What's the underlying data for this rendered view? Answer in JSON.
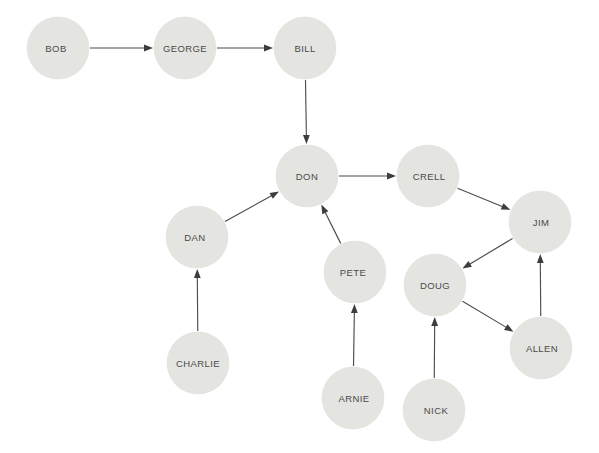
{
  "diagram": {
    "type": "directed-graph",
    "background_color": "#ffffff",
    "node_fill_color": "#e4e4e1",
    "node_text_color": "#4a4a4a",
    "edge_color": "#4d4d4d",
    "node_radius": 31,
    "canvas": {
      "width": 599,
      "height": 453
    },
    "nodes": [
      {
        "id": "bob",
        "label": "BOB",
        "x": 58,
        "y": 48,
        "label_dx": -2
      },
      {
        "id": "george",
        "label": "GEORGE",
        "x": 185,
        "y": 48,
        "label_dx": 0
      },
      {
        "id": "bill",
        "label": "BILL",
        "x": 305,
        "y": 48,
        "label_dx": 0
      },
      {
        "id": "don",
        "label": "DON",
        "x": 307,
        "y": 176,
        "label_dx": 0
      },
      {
        "id": "crell",
        "label": "CRELL",
        "x": 428,
        "y": 176,
        "label_dx": 1
      },
      {
        "id": "jim",
        "label": "JIM",
        "x": 540,
        "y": 222,
        "label_dx": 1
      },
      {
        "id": "dan",
        "label": "DAN",
        "x": 197,
        "y": 237,
        "label_dx": -2
      },
      {
        "id": "pete",
        "label": "PETE",
        "x": 355,
        "y": 272,
        "label_dx": -2
      },
      {
        "id": "doug",
        "label": "DOUG",
        "x": 435,
        "y": 285,
        "label_dx": 0
      },
      {
        "id": "allen",
        "label": "ALLEN",
        "x": 541,
        "y": 348,
        "label_dx": 1
      },
      {
        "id": "charlie",
        "label": "CHARLIE",
        "x": 198,
        "y": 363,
        "label_dx": 0
      },
      {
        "id": "arnie",
        "label": "ARNIE",
        "x": 353,
        "y": 398,
        "label_dx": 1
      },
      {
        "id": "nick",
        "label": "NICK",
        "x": 434,
        "y": 410,
        "label_dx": 2
      }
    ],
    "edges": [
      {
        "id": "bob-george",
        "from": "bob",
        "to": "george",
        "directed": true
      },
      {
        "id": "george-bill",
        "from": "george",
        "to": "bill",
        "directed": true
      },
      {
        "id": "bill-don",
        "from": "bill",
        "to": "don",
        "directed": true
      },
      {
        "id": "don-crell",
        "from": "don",
        "to": "crell",
        "directed": true
      },
      {
        "id": "crell-jim",
        "from": "crell",
        "to": "jim",
        "directed": true
      },
      {
        "id": "jim-doug",
        "from": "jim",
        "to": "doug",
        "directed": true
      },
      {
        "id": "doug-allen",
        "from": "doug",
        "to": "allen",
        "directed": true
      },
      {
        "id": "allen-jim",
        "from": "allen",
        "to": "jim",
        "directed": true
      },
      {
        "id": "nick-doug",
        "from": "nick",
        "to": "doug",
        "directed": true
      },
      {
        "id": "dan-don",
        "from": "dan",
        "to": "don",
        "directed": true
      },
      {
        "id": "charlie-dan",
        "from": "charlie",
        "to": "dan",
        "directed": true
      },
      {
        "id": "pete-don",
        "from": "pete",
        "to": "don",
        "directed": true
      },
      {
        "id": "arnie-pete",
        "from": "arnie",
        "to": "pete",
        "directed": true
      }
    ]
  }
}
